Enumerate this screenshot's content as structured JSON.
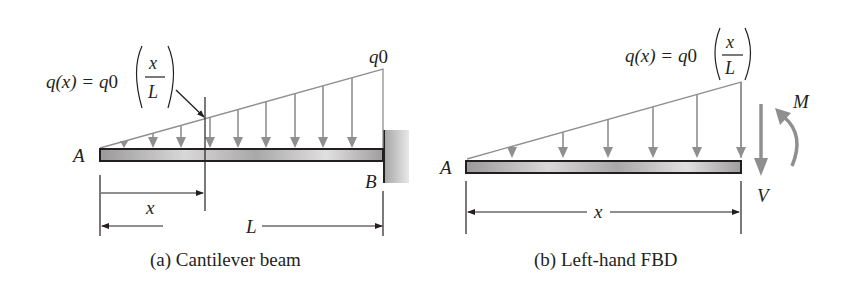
{
  "figure_a": {
    "caption": "(a) Cantilever beam",
    "load_label_lhs": "q(x) = q",
    "load_label_sub": "0",
    "frac_num": "x",
    "frac_den": "L",
    "end_load_label": "q",
    "end_load_sub": "0",
    "point_a": "A",
    "point_b": "B",
    "dim_x": "x",
    "dim_l": "L"
  },
  "figure_b": {
    "caption": "(b) Left-hand FBD",
    "load_label_lhs": "q(x) = q",
    "load_label_sub": "0",
    "frac_num": "x",
    "frac_den": "L",
    "point_a": "A",
    "moment_label": "M",
    "shear_label": "V",
    "dim_x": "x"
  },
  "colors": {
    "load": "#8f8f8f",
    "line": "#231f20",
    "wall": "#b5b5b5"
  }
}
